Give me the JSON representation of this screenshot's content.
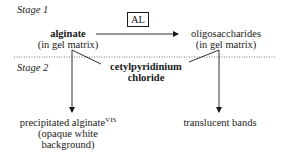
{
  "diagram": {
    "stages": {
      "stage1_label": "Stage 1",
      "stage2_label": "Stage 2"
    },
    "enzyme_label": "AL",
    "nodes": {
      "alginate": {
        "name": "alginate",
        "detail": "(in gel matrix)"
      },
      "oligosaccharides": {
        "name": "oligosaccharides",
        "detail": "(in gel matrix)"
      },
      "reagent": {
        "line1": "cetylpyridinium",
        "line2": "chloride"
      },
      "precipitate": {
        "line1": "precipitated alginate",
        "superscript": "VIS",
        "line2": "(opaque white",
        "line3": "background)"
      },
      "translucent": {
        "label": "translucent bands"
      }
    },
    "edges": [
      {
        "from": "alginate",
        "to": "oligosaccharides",
        "label": "AL",
        "style": "arrow"
      },
      {
        "from": "alginate",
        "to": "precipitate",
        "style": "arrow"
      },
      {
        "from": "oligosaccharides",
        "to": "translucent",
        "style": "arrow"
      },
      {
        "from": "reagent",
        "to": "alginate",
        "style": "line"
      },
      {
        "from": "reagent",
        "to": "oligosaccharides",
        "style": "line"
      }
    ],
    "separator": "dotted",
    "colors": {
      "ink": "#1a1a1a",
      "background": "#ffffff"
    }
  }
}
